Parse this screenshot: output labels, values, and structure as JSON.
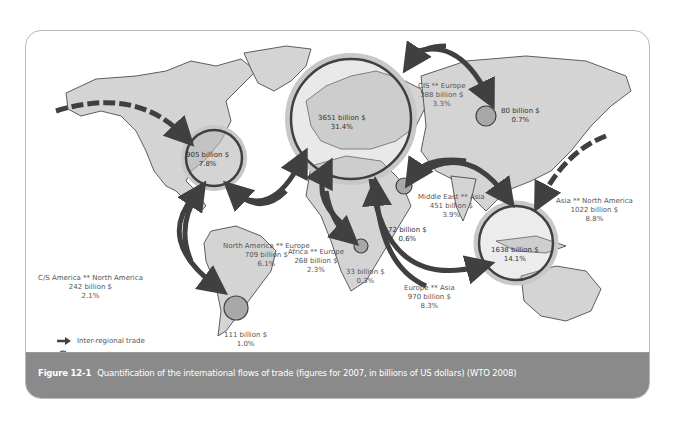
{
  "caption": {
    "figure_number": "Figure 12-1",
    "text": "Quantification of the international flows of trade (figures for 2007, in billions of US dollars) (WTO 2008)"
  },
  "legend": {
    "inter": "Inter-regional trade",
    "intra": "Intra-regional trade"
  },
  "colors": {
    "land": "#d4d4d4",
    "coast": "#3a3a3a",
    "arrow": "#404040",
    "intra_fill": "#a8a8a8",
    "ring_outer": "#c0c0c0",
    "caption_bg": "#8a8a8a"
  },
  "intra_regional": [
    {
      "id": "north-america",
      "value": "905 billion $",
      "share": "7.8%"
    },
    {
      "id": "europe",
      "value": "3651 billion $",
      "share": "31.4%"
    },
    {
      "id": "cis",
      "value": "80 billion $",
      "share": "0.7%"
    },
    {
      "id": "middle-east",
      "value": "72 billion $",
      "share": "0.6%"
    },
    {
      "id": "asia",
      "value": "1638 billion $",
      "share": "14.1%"
    },
    {
      "id": "africa",
      "value": "33 billion $",
      "share": "0.3%"
    },
    {
      "id": "south-america",
      "value": "111 billion $",
      "share": "1.0%"
    }
  ],
  "inter_regional": [
    {
      "id": "na-europe",
      "route": "North America ** Europe",
      "value": "709 billion $",
      "share": "6.1%"
    },
    {
      "id": "csa-na",
      "route": "C/S America ** North America",
      "value": "242 billion $",
      "share": "2.1%"
    },
    {
      "id": "cis-europe",
      "route": "CIS ** Europe",
      "value": "388 billion $",
      "share": "3.3%"
    },
    {
      "id": "me-asia",
      "route": "Middle East ** Asia",
      "value": "451 billion $",
      "share": "3.9%"
    },
    {
      "id": "asia-na",
      "route": "Asia ** North America",
      "value": "1022 billion $",
      "share": "8.8%"
    },
    {
      "id": "africa-europe",
      "route": "Africa ** Europe",
      "value": "268 billion $",
      "share": "2.3%"
    },
    {
      "id": "europe-asia",
      "route": "Europe ** Asia",
      "value": "970 billion $",
      "share": "8.3%"
    }
  ]
}
